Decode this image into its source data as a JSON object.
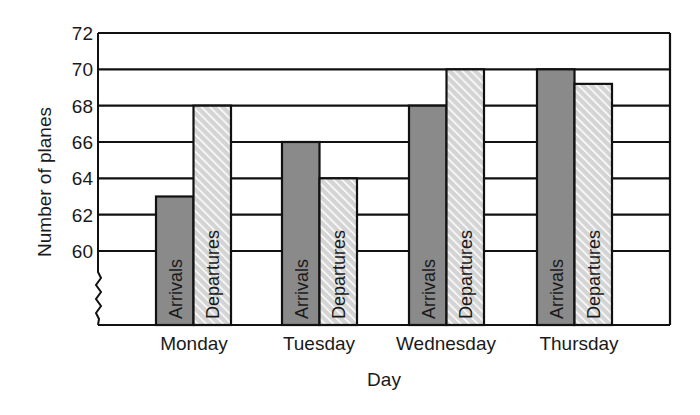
{
  "chart_data": {
    "type": "bar",
    "title": "",
    "xlabel": "Day",
    "ylabel": "Number of planes",
    "categories": [
      "Monday",
      "Tuesday",
      "Wednesday",
      "Thursday"
    ],
    "series": [
      {
        "name": "Arrivals",
        "values": [
          63,
          66,
          68,
          70
        ],
        "color": "#8a8a8a",
        "pattern": "solid"
      },
      {
        "name": "Departures",
        "values": [
          68,
          64,
          70,
          69.2
        ],
        "color": "#d9d9d9",
        "pattern": "diagonal-hatch"
      }
    ],
    "yticks": [
      60,
      62,
      64,
      66,
      68,
      70,
      72
    ],
    "ylim": [
      56,
      72
    ],
    "axis_break": true,
    "grid": "horizontal",
    "legend": "none (labels written inside bars)"
  },
  "labels": {
    "xlabel": "Day",
    "ylabel": "Number of planes"
  },
  "colors": {
    "arrivals": "#8a8a8a",
    "departures_bg": "#dcdcdc",
    "departures_stripe": "#ffffff",
    "line": "#111111"
  }
}
